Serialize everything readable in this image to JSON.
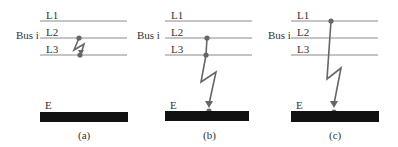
{
  "colors": {
    "line": "#8a8a8a",
    "fault": "#666666",
    "ground": "#111111",
    "text": "#333333"
  },
  "panels": [
    {
      "caption": "(a)",
      "bus_label": "Bus i",
      "lines": [
        "L1",
        "L2",
        "L3"
      ],
      "ground_label": "E",
      "fault_type": "line-to-line (L2-L3)"
    },
    {
      "caption": "(b)",
      "bus_label": "Bus i",
      "lines": [
        "L1",
        "L2",
        "L3"
      ],
      "ground_label": "E",
      "fault_type": "double line-to-ground (L2-L3-E)"
    },
    {
      "caption": "(c)",
      "bus_label": "Bus i",
      "lines": [
        "L1",
        "L2",
        "L3"
      ],
      "ground_label": "E",
      "fault_type": "single line-to-ground (L1-E)"
    }
  ]
}
